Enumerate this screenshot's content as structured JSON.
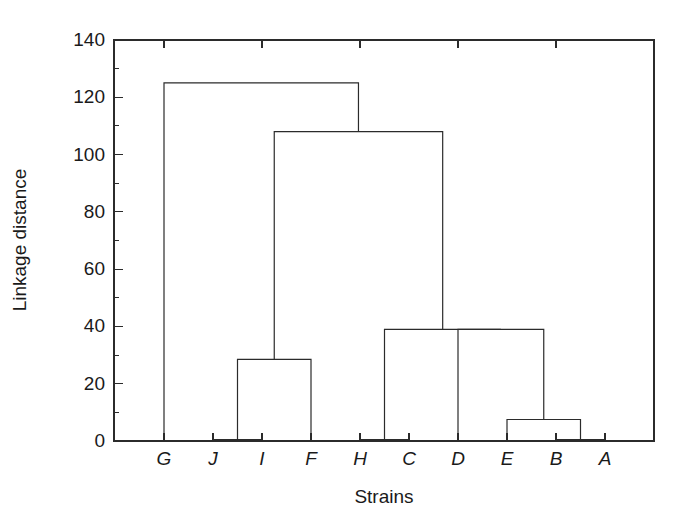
{
  "chart_data": {
    "type": "line",
    "subtype": "dendrogram",
    "title": "",
    "xlabel": "Strains",
    "ylabel": "Linkage distance",
    "grid": false,
    "legend": null,
    "orientation": "vertical",
    "ylim": [
      0,
      140
    ],
    "y_major_ticks": [
      0,
      20,
      40,
      60,
      80,
      100,
      120,
      140
    ],
    "y_minor_tick_step": 10,
    "y_tick_labels": [
      "0",
      "20",
      "40",
      "60",
      "80",
      "100",
      "120",
      "140"
    ],
    "leaves": [
      "G",
      "J",
      "I",
      "F",
      "H",
      "C",
      "D",
      "E",
      "B",
      "A"
    ],
    "leaf_labels_italic": true,
    "merges": [
      {
        "id": "n1",
        "label": "J + I",
        "children": [
          "J",
          "I"
        ],
        "height": 0.5
      },
      {
        "id": "n2",
        "label": "(J,I) + F",
        "children": [
          "n1",
          "F"
        ],
        "height": 28.5
      },
      {
        "id": "n3",
        "label": "H + C",
        "children": [
          "H",
          "C"
        ],
        "height": 0.5
      },
      {
        "id": "n4",
        "label": "B + A",
        "children": [
          "B",
          "A"
        ],
        "height": 0.5
      },
      {
        "id": "n5",
        "label": "E + (B,A)",
        "children": [
          "E",
          "n4"
        ],
        "height": 7.5
      },
      {
        "id": "n6",
        "label": "D + (E,(B,A))",
        "children": [
          "D",
          "n5"
        ],
        "height": 39.0
      },
      {
        "id": "n7",
        "label": "(H,C) + (D,E,B,A)",
        "children": [
          "n3",
          "n6"
        ],
        "height": 39.0
      },
      {
        "id": "n8",
        "label": "(J,I,F) + (H,C,D,E,B,A)",
        "children": [
          "n2",
          "n7"
        ],
        "height": 108.0
      },
      {
        "id": "n9",
        "label": "G + rest",
        "children": [
          "G",
          "n8"
        ],
        "height": 125.0
      }
    ],
    "root": "n9",
    "series": [
      {
        "name": "linkage heights",
        "values": [
          0.5,
          28.5,
          0.5,
          0.5,
          7.5,
          39.0,
          39.0,
          108.0,
          125.0
        ]
      }
    ],
    "colors": {
      "line": "#2b2b2b",
      "axis": "#2b2b2b",
      "text": "#1a1a1a",
      "background": "#ffffff"
    }
  },
  "plot": {
    "x_axis_title": "Strains",
    "y_axis_title": "Linkage distance"
  }
}
